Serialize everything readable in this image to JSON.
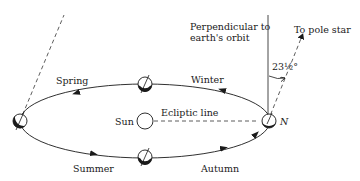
{
  "diagram": {
    "labels": {
      "perpendicular_line1": "Perpendicular to",
      "perpendicular_line2": "earth's orbit",
      "pole_star": "To pole star",
      "angle": "23½°",
      "winter": "Winter",
      "spring": "Spring",
      "summer": "Summer",
      "autumn": "Autumn",
      "sun": "Sun",
      "ecliptic": "Ecliptic line",
      "north": "N"
    },
    "colors": {
      "ink": "#1a1a1a",
      "background": "#ffffff",
      "dashed": "#444444"
    },
    "earth_positions": [
      {
        "name": "left",
        "x": 20,
        "y": 121
      },
      {
        "name": "top",
        "x": 145,
        "y": 84
      },
      {
        "name": "bottom",
        "x": 145,
        "y": 157
      },
      {
        "name": "right",
        "x": 269,
        "y": 121
      }
    ]
  }
}
